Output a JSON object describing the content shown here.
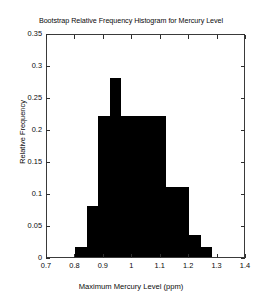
{
  "chart_data": {
    "type": "bar",
    "title": "Bootstrap Relative Frequency Histogram for Mercury Level",
    "xlabel": "Maximum Mercury Level (ppm)",
    "ylabel": "Relative Frequency",
    "xlim": [
      0.7,
      1.4
    ],
    "ylim": [
      0,
      0.35
    ],
    "grid": false,
    "legend": null,
    "bin_width": 0.04,
    "bin_edges": [
      0.8,
      0.84,
      0.88,
      0.92,
      0.96,
      1.0,
      1.04,
      1.08,
      1.12,
      1.16,
      1.2,
      1.24,
      1.28
    ],
    "categories": [
      "0.80-0.84",
      "0.84-0.88",
      "0.88-0.92",
      "0.92-0.96",
      "0.96-1.00",
      "1.00-1.04",
      "1.04-1.08",
      "1.08-1.12",
      "1.12-1.16",
      "1.16-1.20",
      "1.20-1.24",
      "1.24-1.28"
    ],
    "values": [
      0.015,
      0.08,
      0.22,
      0.28,
      0.22,
      0.22,
      0.22,
      0.22,
      0.11,
      0.11,
      0.035,
      0.015
    ],
    "x_ticks": [
      0.7,
      0.8,
      0.9,
      1.0,
      1.1,
      1.2,
      1.3,
      1.4
    ],
    "x_tick_labels": [
      "0.7",
      "0.8",
      "0.9",
      "1",
      "1.1",
      "1.2",
      "1.3",
      "1.4"
    ],
    "y_ticks": [
      0,
      0.05,
      0.1,
      0.15,
      0.2,
      0.25,
      0.3,
      0.35
    ],
    "y_tick_labels": [
      "0",
      "0.05",
      "0.1",
      "0.15",
      "0.2",
      "0.25",
      "0.3",
      "0.35"
    ],
    "bar_color": "#000000",
    "axis_color": "#3a3a3a",
    "background_color": "#ffffff"
  }
}
